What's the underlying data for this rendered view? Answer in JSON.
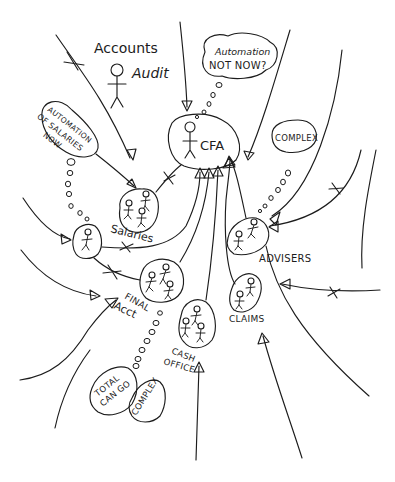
{
  "diagram": {
    "style": "hand-drawn rich picture",
    "colors": {
      "ink": "#1c1c1c",
      "background": "#ffffff"
    },
    "labels": {
      "accounts": "Accounts",
      "audit": "Audit",
      "cfa": "CFA",
      "salaries": "Salaries",
      "advisers": "ADVISERS",
      "final_acct_line1": "FINAL",
      "final_acct_line2": "Acct",
      "claims": "CLAIMS",
      "cash_office_line1": "CASH",
      "cash_office_line2": "OFFICE"
    },
    "thought_bubbles": {
      "cfa_line1": "Automation",
      "cfa_line2": "NOT NOW?",
      "salaries_line1": "AUTOMATION",
      "salaries_line2": "OF SALARIES",
      "salaries_line3": "NOW",
      "advisers": "COMPLEX",
      "final_acct_a_line1": "TOTAL",
      "final_acct_a_line2": "CAN GO",
      "final_acct_b": "COMPLEX"
    },
    "nodes": [
      {
        "id": "accounts-audit",
        "label": "Accounts Audit",
        "people": 1
      },
      {
        "id": "cfa",
        "label": "CFA",
        "people": 1
      },
      {
        "id": "salaries",
        "label": "Salaries",
        "people": 3
      },
      {
        "id": "unnamed-individual",
        "label": "",
        "people": 1
      },
      {
        "id": "advisers",
        "label": "Advisers",
        "people": 2
      },
      {
        "id": "final-acct",
        "label": "Final Acct",
        "people": 3
      },
      {
        "id": "cash-office",
        "label": "Cash Office",
        "people": 3
      },
      {
        "id": "claims",
        "label": "Claims",
        "people": 2
      }
    ],
    "edges": [
      {
        "from": "salaries",
        "to": "cfa",
        "conflict": true
      },
      {
        "from": "unnamed-individual",
        "to": "cfa",
        "conflict": true
      },
      {
        "from": "unnamed-individual",
        "to": "final-acct",
        "conflict": true
      },
      {
        "from": "final-acct",
        "to": "cfa",
        "conflict": false
      },
      {
        "from": "cash-office",
        "to": "cfa",
        "conflict": false
      },
      {
        "from": "claims",
        "to": "cfa",
        "conflict": false
      },
      {
        "from": "advisers",
        "to": "cfa",
        "conflict": false
      },
      {
        "from": "external",
        "to": "advisers",
        "conflict": true
      },
      {
        "from": "external",
        "to": "claims",
        "conflict": true
      },
      {
        "from": "external",
        "to": "salaries",
        "conflict": true
      }
    ]
  }
}
